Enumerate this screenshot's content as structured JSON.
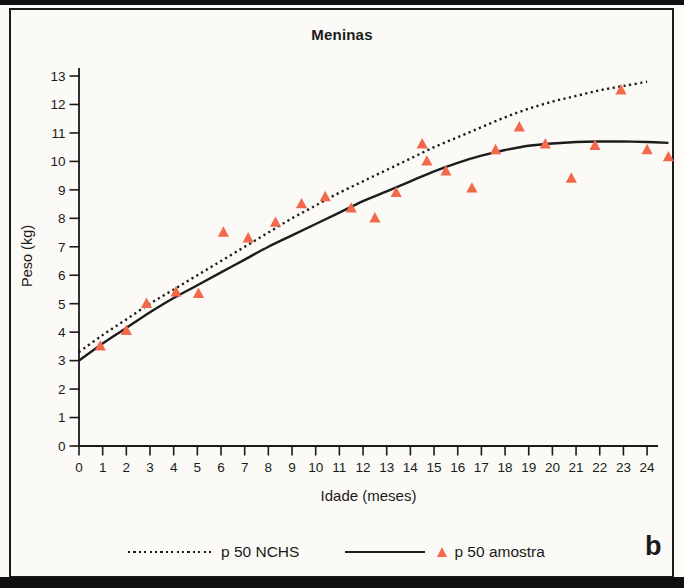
{
  "chart_data": {
    "type": "line",
    "title": "Meninas",
    "xlabel": "Idade (meses)",
    "ylabel": "Peso (kg)",
    "panel_label": "b",
    "xlim": [
      0,
      24
    ],
    "ylim": [
      0,
      13
    ],
    "grid": false,
    "legend_position": "bottom",
    "x_ticks": [
      0,
      1,
      2,
      3,
      4,
      5,
      6,
      7,
      8,
      9,
      10,
      11,
      12,
      13,
      14,
      15,
      16,
      17,
      18,
      19,
      20,
      21,
      22,
      23,
      24
    ],
    "y_ticks": [
      0,
      1,
      2,
      3,
      4,
      5,
      6,
      7,
      8,
      9,
      10,
      11,
      12,
      13
    ],
    "axis_color": "#1a1a1a",
    "marker_color": "#f26a4b",
    "series": [
      {
        "name": "p 50 NCHS",
        "type": "line",
        "line_style": "dotted",
        "color": "#1c1c1c",
        "x": [
          0,
          1,
          2,
          3,
          4,
          5,
          6,
          7,
          8,
          9,
          10,
          11,
          12,
          13,
          14,
          15,
          16,
          17,
          18,
          19,
          20,
          21,
          22,
          23,
          24
        ],
        "values": [
          3.3,
          3.9,
          4.45,
          5.0,
          5.5,
          6.0,
          6.5,
          7.0,
          7.5,
          8.0,
          8.45,
          8.9,
          9.3,
          9.7,
          10.1,
          10.5,
          10.85,
          11.2,
          11.55,
          11.85,
          12.1,
          12.3,
          12.5,
          12.65,
          12.8
        ]
      },
      {
        "name": "p 50 amostra",
        "type": "line",
        "line_style": "solid",
        "color": "#1c1c1c",
        "x": [
          0,
          1,
          2,
          3,
          4,
          5,
          6,
          7,
          8,
          9,
          10,
          11,
          12,
          13,
          14,
          15,
          16,
          17,
          18,
          19,
          20,
          21,
          22,
          23,
          24,
          24.9
        ],
        "values": [
          3.0,
          3.6,
          4.15,
          4.7,
          5.2,
          5.65,
          6.1,
          6.55,
          7.0,
          7.4,
          7.8,
          8.2,
          8.6,
          8.95,
          9.3,
          9.65,
          9.95,
          10.2,
          10.4,
          10.55,
          10.63,
          10.68,
          10.7,
          10.7,
          10.68,
          10.65
        ]
      },
      {
        "name": "p 50 amostra",
        "type": "scatter",
        "marker": "triangle",
        "color": "#f26a4b",
        "points": [
          [
            0.9,
            3.5
          ],
          [
            2.0,
            4.05
          ],
          [
            2.85,
            5.0
          ],
          [
            4.1,
            5.4
          ],
          [
            5.05,
            5.35
          ],
          [
            6.1,
            7.5
          ],
          [
            7.15,
            7.3
          ],
          [
            8.3,
            7.85
          ],
          [
            9.4,
            8.5
          ],
          [
            10.4,
            8.75
          ],
          [
            11.5,
            8.35
          ],
          [
            12.5,
            8.0
          ],
          [
            13.4,
            8.9
          ],
          [
            14.5,
            10.6
          ],
          [
            14.7,
            10.0
          ],
          [
            15.5,
            9.65
          ],
          [
            16.6,
            9.05
          ],
          [
            17.6,
            10.4
          ],
          [
            18.6,
            11.2
          ],
          [
            19.7,
            10.6
          ],
          [
            20.8,
            9.4
          ],
          [
            21.8,
            10.55
          ],
          [
            22.9,
            12.5
          ],
          [
            24.0,
            10.4
          ],
          [
            24.9,
            10.15
          ]
        ]
      }
    ]
  }
}
